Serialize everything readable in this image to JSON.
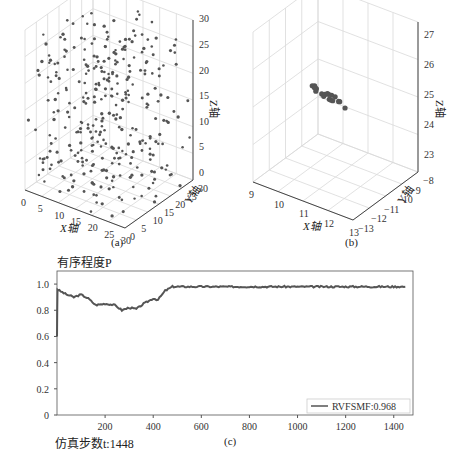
{
  "panels": {
    "a": {
      "label": "(a)",
      "xlabel": "X轴",
      "ylabel": "Y轴",
      "zlabel": "Z轴",
      "xticks": [
        "0",
        "5",
        "10",
        "15",
        "20",
        "25",
        "30"
      ],
      "yticks": [
        "0",
        "5",
        "10",
        "15",
        "20",
        "25",
        "30"
      ],
      "zticks": [
        "0",
        "5",
        "10",
        "15",
        "20",
        "25",
        "30"
      ]
    },
    "b": {
      "label": "(b)",
      "xlabel": "X轴",
      "ylabel": "Y轴",
      "zlabel": "Z轴",
      "xticks": [
        "9",
        "10",
        "11",
        "12",
        "13"
      ],
      "yticks": [
        "−13",
        "−12",
        "−11",
        "−10",
        "−9",
        "−8"
      ],
      "zticks": [
        "23",
        "24",
        "25",
        "26",
        "27"
      ]
    },
    "c": {
      "label": "(c)",
      "ytitle": "有序程度P",
      "xtitle": "仿真步数t:1448",
      "legend": "RVFSMF:0.968"
    }
  },
  "caption": "图 粒子群体的运动状态与有序程度",
  "chart_data": [
    {
      "type": "scatter",
      "title": "(a)",
      "subtype": "3d",
      "xlabel": "X轴",
      "ylabel": "Y轴",
      "zlabel": "Z轴",
      "xlim": [
        0,
        30
      ],
      "ylim": [
        0,
        30
      ],
      "zlim": [
        0,
        30
      ],
      "description": "randomly scattered particles filling cube"
    },
    {
      "type": "scatter",
      "title": "(b)",
      "subtype": "3d",
      "xlabel": "X轴",
      "ylabel": "Y轴",
      "zlabel": "Z轴",
      "xlim": [
        9,
        13
      ],
      "ylim": [
        -13,
        -8
      ],
      "zlim": [
        23,
        27
      ],
      "description": "particles clustered in tight group near z≈24.5"
    },
    {
      "type": "line",
      "title": "(c)",
      "xlabel": "仿真步数t:1448",
      "ylabel": "有序程度P",
      "xlim": [
        0,
        1480
      ],
      "ylim": [
        0,
        1.1
      ],
      "xticks": [
        200,
        400,
        600,
        800,
        1000,
        1200,
        1400
      ],
      "yticks": [
        0,
        0.2,
        0.4,
        0.6,
        0.8,
        1.0
      ],
      "series": [
        {
          "name": "RVFSMF:0.968",
          "x": [
            0,
            2,
            10,
            40,
            70,
            100,
            130,
            160,
            200,
            240,
            270,
            300,
            330,
            360,
            400,
            420,
            450,
            480,
            520,
            600,
            800,
            1000,
            1200,
            1448
          ],
          "y": [
            0.6,
            0.96,
            0.95,
            0.92,
            0.9,
            0.92,
            0.89,
            0.84,
            0.85,
            0.84,
            0.8,
            0.82,
            0.81,
            0.85,
            0.89,
            0.88,
            0.95,
            0.98,
            0.98,
            0.98,
            0.98,
            0.98,
            0.98,
            0.98
          ]
        }
      ],
      "legend_position": "lower right"
    }
  ]
}
